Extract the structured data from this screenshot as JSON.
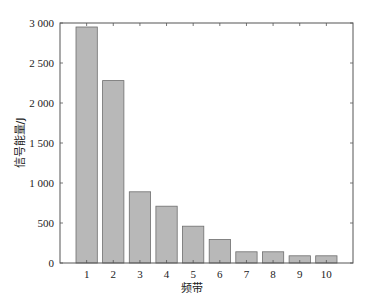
{
  "chart_data": {
    "type": "bar",
    "title": "",
    "xlabel": "频带",
    "ylabel": "信号能量/J",
    "categories": [
      "1",
      "2",
      "3",
      "4",
      "5",
      "6",
      "7",
      "8",
      "9",
      "10"
    ],
    "values": [
      2950,
      2280,
      890,
      710,
      460,
      295,
      140,
      140,
      90,
      90
    ],
    "ylim": [
      0,
      3000
    ],
    "xlim": [
      0,
      11
    ],
    "yticks": [
      0,
      500,
      1000,
      1500,
      2000,
      2500,
      3000
    ],
    "ytick_labels": [
      "0",
      "500",
      "1 000",
      "1 500",
      "2 000",
      "2 500",
      "3 000"
    ],
    "grid": false,
    "legend": null,
    "bar_color": "#b8b8b8",
    "bar_edge_color": "#6e6e6e"
  }
}
